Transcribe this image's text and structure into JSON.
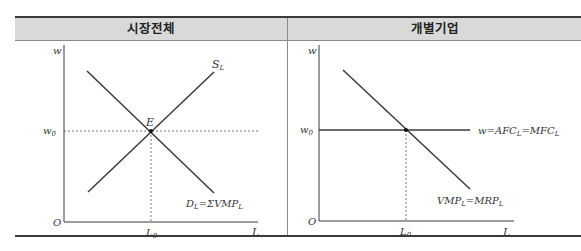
{
  "headers": {
    "left": "시장전체",
    "right": "개별기업"
  },
  "left_panel": {
    "y_axis_label": "w",
    "x_axis_label": "L",
    "origin_label": "O",
    "equilibrium_wage": {
      "base": "w",
      "sub": "0"
    },
    "equilibrium_quantity": {
      "base": "L",
      "sub": "0"
    },
    "equilibrium_point": "E",
    "supply_label": {
      "base": "S",
      "sub": "L"
    },
    "demand_label": {
      "d_base": "D",
      "d_sub": "L",
      "rest": "=ΣVMP",
      "rest_sub": "L"
    }
  },
  "right_panel": {
    "y_axis_label": "w",
    "x_axis_label": "L",
    "origin_label": "O",
    "wage": {
      "base": "w",
      "sub": "0"
    },
    "quantity": {
      "base": "L",
      "sub": "0"
    },
    "supply_label": {
      "p1": "w=AFC",
      "s1": "L",
      "p2": "=MFC",
      "s2": "L"
    },
    "demand_label": {
      "p1": "VMP",
      "s1": "L",
      "p2": "=MRP",
      "s2": "L"
    }
  },
  "colors": {
    "line": "#3a3a3a",
    "header_bg": "#d9d9d9",
    "rule": "#3a3a3a"
  }
}
